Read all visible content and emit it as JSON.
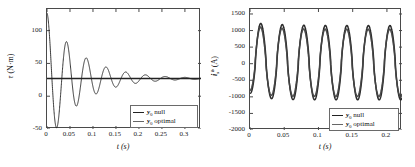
{
  "figure": {
    "background": "#ffffff",
    "line_color": "#222222",
    "frame_color": "#4a4a4a"
  },
  "panels": [
    {
      "id": "torque-panel",
      "legend": {
        "position": "bottom-right",
        "entries": [
          {
            "prefix": "y",
            "sub": "0",
            "text": " null"
          },
          {
            "prefix": "y",
            "sub": "0",
            "text": " optimal"
          }
        ]
      }
    },
    {
      "id": "current-panel",
      "legend": {
        "position": "bottom-right",
        "entries": [
          {
            "prefix": "y",
            "sub": "0",
            "text": " null"
          },
          {
            "prefix": "y",
            "sub": "0",
            "text": " optimal"
          }
        ]
      }
    }
  ],
  "chart_data": [
    {
      "type": "line",
      "id": "torque-vs-time",
      "title": "",
      "xlabel": "t (s)",
      "ylabel": "τ (N·m)",
      "ylabel_symbol": "τ",
      "ylabel_units": "(N·m)",
      "xlim": [
        0,
        0.335
      ],
      "ylim": [
        -50,
        133
      ],
      "xticks": [
        0,
        0.05,
        0.1,
        0.15,
        0.2,
        0.25,
        0.3
      ],
      "xticklabels": [
        "0",
        "0.05",
        "0.1",
        "0.15",
        "0.2",
        "0.25",
        "0.3"
      ],
      "yticks": [
        -50,
        0,
        50,
        100
      ],
      "yticklabels": [
        "-50",
        "0",
        "50",
        "100"
      ],
      "grid": false,
      "legend_position": "lower right",
      "series": [
        {
          "name": "y0 null",
          "description": "damped oscillation settling to 27 N-m",
          "model": "damped_sine",
          "amplitude": 100,
          "decay": 13.5,
          "frequency_hz": 23.3,
          "offset": 27,
          "phase": 0,
          "t_start": 0,
          "t_end": 0.335
        },
        {
          "name": "y0 optimal",
          "description": "constant steady torque",
          "model": "constant",
          "value": 27,
          "t_start": 0,
          "t_end": 0.335
        }
      ]
    },
    {
      "type": "line",
      "id": "current-vs-time",
      "title": "",
      "xlabel": "t (s)",
      "ylabel": "i_s^b (A)",
      "ylabel_symbol": "i",
      "ylabel_sub": "s",
      "ylabel_sup": "b",
      "ylabel_units": "(A)",
      "xlim": [
        0,
        0.222
      ],
      "ylim": [
        -2000,
        1650
      ],
      "xticks": [
        0,
        0.05,
        0.1,
        0.15,
        0.2
      ],
      "xticklabels": [
        "0",
        "0.05",
        "0.1",
        "0.15",
        "0.2"
      ],
      "yticks": [
        -2000,
        -1500,
        -1000,
        -500,
        0,
        500,
        1000,
        1500
      ],
      "yticklabels": [
        "-2000",
        "-1500",
        "-1000",
        "-500",
        "0",
        "500",
        "1000",
        "1500"
      ],
      "grid": false,
      "legend_position": "lower right",
      "series": [
        {
          "name": "y0 null",
          "description": "sustained oscillation, first peak highest",
          "model": "decaying_sine_to_steady",
          "peak_first": 1420,
          "peak_steady": 1150,
          "trough_steady": -1090,
          "frequency_hz": 31.8,
          "t_start": 0,
          "t_end": 0.222
        },
        {
          "name": "y0 optimal",
          "description": "overlapping oscillation, nearly identical envelope",
          "model": "decaying_sine_to_steady",
          "peak_first": 1330,
          "peak_steady": 1080,
          "trough_steady": -1030,
          "frequency_hz": 31.8,
          "t_start": 0,
          "t_end": 0.222
        }
      ]
    }
  ]
}
